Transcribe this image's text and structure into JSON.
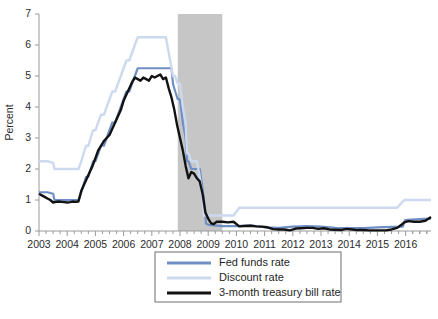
{
  "chart_data": {
    "type": "line",
    "title": "",
    "subtitle": "",
    "xlabel": "",
    "ylabel": "Percent",
    "ylim": [
      0,
      7
    ],
    "ytick_labels": [
      "0",
      "1",
      "2",
      "3",
      "4",
      "5",
      "6",
      "7"
    ],
    "ytick_values": [
      0,
      1,
      2,
      3,
      4,
      5,
      6,
      7
    ],
    "xlim": [
      2003.0,
      2016.9
    ],
    "xtick_labels": [
      "2003",
      "2004",
      "2005",
      "2006",
      "2007",
      "2008",
      "2009",
      "2010",
      "2011",
      "2012",
      "2013",
      "2014",
      "2015",
      "2016"
    ],
    "xtick_values": [
      2003,
      2004,
      2005,
      2006,
      2007,
      2008,
      2009,
      2010,
      2011,
      2012,
      2013,
      2014,
      2015,
      2016
    ],
    "x_minor_per_major": 4,
    "grid": false,
    "legend_position": "below-center",
    "annotations": [
      {
        "type": "shaded-band",
        "name": "recession-band",
        "x_start": 2007.92,
        "x_end": 2009.5,
        "color": "#c6c6c6",
        "label": ""
      }
    ],
    "series": [
      {
        "name": "Fed funds rate",
        "color": "#6f8fc4",
        "width": 2.2,
        "x": [
          2003.0,
          2003.3,
          2003.5,
          2003.55,
          2004.0,
          2004.4,
          2004.5,
          2004.58,
          2004.67,
          2004.75,
          2004.83,
          2004.92,
          2005.0,
          2005.1,
          2005.2,
          2005.3,
          2005.4,
          2005.5,
          2005.6,
          2005.7,
          2005.8,
          2005.9,
          2006.0,
          2006.1,
          2006.2,
          2006.3,
          2006.4,
          2006.5,
          2006.6,
          2007.0,
          2007.5,
          2007.7,
          2007.75,
          2007.83,
          2007.92,
          2008.0,
          2008.1,
          2008.2,
          2008.25,
          2008.3,
          2008.4,
          2008.5,
          2008.6,
          2008.7,
          2008.78,
          2008.85,
          2008.92,
          2009.0,
          2009.2,
          2009.5,
          2010.0,
          2010.5,
          2011.0,
          2011.5,
          2012.0,
          2012.5,
          2013.0,
          2013.5,
          2014.0,
          2014.5,
          2015.0,
          2015.5,
          2015.9,
          2015.98,
          2016.2,
          2016.5,
          2016.9
        ],
        "values": [
          1.25,
          1.25,
          1.2,
          1.0,
          1.0,
          1.0,
          1.25,
          1.5,
          1.75,
          1.75,
          2.0,
          2.25,
          2.25,
          2.5,
          2.75,
          2.75,
          3.0,
          3.25,
          3.5,
          3.5,
          3.75,
          4.0,
          4.25,
          4.5,
          4.5,
          4.75,
          5.0,
          5.25,
          5.25,
          5.25,
          5.25,
          5.25,
          4.75,
          4.5,
          4.25,
          4.25,
          3.5,
          3.0,
          2.25,
          2.25,
          2.0,
          2.0,
          2.0,
          2.0,
          1.5,
          1.0,
          0.25,
          0.2,
          0.18,
          0.16,
          0.16,
          0.18,
          0.12,
          0.1,
          0.14,
          0.16,
          0.14,
          0.1,
          0.09,
          0.09,
          0.12,
          0.13,
          0.14,
          0.35,
          0.37,
          0.38,
          0.4
        ]
      },
      {
        "name": "Discount rate",
        "color": "#ccd9ee",
        "width": 2.4,
        "x": [
          2003.0,
          2003.3,
          2003.5,
          2003.55,
          2004.0,
          2004.4,
          2004.5,
          2004.58,
          2004.67,
          2004.75,
          2004.83,
          2004.92,
          2005.0,
          2005.1,
          2005.2,
          2005.3,
          2005.4,
          2005.5,
          2005.6,
          2005.7,
          2005.8,
          2005.9,
          2006.0,
          2006.1,
          2006.2,
          2006.3,
          2006.4,
          2006.5,
          2006.6,
          2007.0,
          2007.5,
          2007.6,
          2007.7,
          2007.75,
          2007.83,
          2007.92,
          2008.0,
          2008.1,
          2008.2,
          2008.25,
          2008.3,
          2008.4,
          2008.5,
          2008.6,
          2008.7,
          2008.78,
          2008.85,
          2008.92,
          2009.0,
          2009.2,
          2009.5,
          2009.7,
          2009.9,
          2010.1,
          2010.5,
          2011.0,
          2012.0,
          2013.0,
          2014.0,
          2015.0,
          2015.7,
          2015.95,
          2016.1,
          2016.5,
          2016.9
        ],
        "values": [
          2.25,
          2.25,
          2.2,
          2.0,
          2.0,
          2.0,
          2.25,
          2.5,
          2.75,
          2.75,
          3.0,
          3.25,
          3.25,
          3.5,
          3.75,
          3.75,
          4.0,
          4.25,
          4.5,
          4.5,
          4.75,
          5.0,
          5.25,
          5.5,
          5.5,
          5.75,
          6.0,
          6.25,
          6.25,
          6.25,
          6.25,
          5.75,
          5.25,
          5.0,
          5.0,
          4.75,
          4.75,
          4.0,
          3.5,
          2.5,
          2.5,
          2.25,
          2.25,
          2.25,
          1.75,
          1.25,
          0.5,
          0.5,
          0.5,
          0.5,
          0.5,
          0.5,
          0.5,
          0.75,
          0.75,
          0.75,
          0.75,
          0.75,
          0.75,
          0.75,
          0.75,
          1.0,
          1.0,
          1.0,
          1.0
        ]
      },
      {
        "name": "3-month treasury bill rate",
        "color": "#121212",
        "width": 2.4,
        "x": [
          2003.0,
          2003.1,
          2003.2,
          2003.3,
          2003.4,
          2003.5,
          2003.6,
          2003.7,
          2003.8,
          2003.9,
          2004.0,
          2004.1,
          2004.2,
          2004.3,
          2004.4,
          2004.5,
          2004.6,
          2004.7,
          2004.8,
          2004.9,
          2005.0,
          2005.1,
          2005.2,
          2005.3,
          2005.4,
          2005.5,
          2005.6,
          2005.7,
          2005.8,
          2005.9,
          2006.0,
          2006.1,
          2006.2,
          2006.3,
          2006.4,
          2006.5,
          2006.6,
          2006.7,
          2006.8,
          2006.9,
          2007.0,
          2007.1,
          2007.2,
          2007.3,
          2007.4,
          2007.5,
          2007.6,
          2007.7,
          2007.8,
          2007.9,
          2008.0,
          2008.1,
          2008.2,
          2008.3,
          2008.4,
          2008.5,
          2008.6,
          2008.7,
          2008.8,
          2008.9,
          2009.0,
          2009.1,
          2009.2,
          2009.3,
          2009.5,
          2009.7,
          2009.9,
          2010.1,
          2010.3,
          2010.5,
          2010.7,
          2010.9,
          2011.1,
          2011.3,
          2011.5,
          2011.7,
          2011.9,
          2012.1,
          2012.3,
          2012.5,
          2012.7,
          2012.9,
          2013.1,
          2013.3,
          2013.5,
          2013.7,
          2013.9,
          2014.1,
          2014.3,
          2014.5,
          2014.7,
          2014.9,
          2015.1,
          2015.3,
          2015.5,
          2015.7,
          2015.85,
          2015.95,
          2016.1,
          2016.3,
          2016.5,
          2016.7,
          2016.9
        ],
        "values": [
          1.2,
          1.15,
          1.1,
          1.05,
          1.0,
          0.92,
          0.94,
          0.95,
          0.94,
          0.93,
          0.92,
          0.93,
          0.95,
          0.94,
          0.95,
          1.3,
          1.5,
          1.7,
          1.9,
          2.1,
          2.35,
          2.6,
          2.75,
          2.9,
          3.0,
          3.1,
          3.3,
          3.5,
          3.7,
          3.9,
          4.2,
          4.4,
          4.6,
          4.8,
          4.95,
          4.9,
          4.85,
          4.95,
          4.9,
          4.85,
          5.0,
          4.95,
          5.0,
          5.05,
          4.9,
          4.95,
          4.6,
          4.3,
          3.9,
          3.4,
          3.0,
          2.6,
          2.1,
          1.7,
          1.9,
          1.85,
          1.7,
          1.6,
          1.2,
          0.6,
          0.4,
          0.25,
          0.22,
          0.3,
          0.3,
          0.28,
          0.3,
          0.15,
          0.16,
          0.17,
          0.15,
          0.14,
          0.12,
          0.06,
          0.05,
          0.05,
          0.02,
          0.08,
          0.09,
          0.1,
          0.1,
          0.07,
          0.09,
          0.05,
          0.04,
          0.03,
          0.07,
          0.05,
          0.03,
          0.03,
          0.02,
          0.02,
          0.02,
          0.02,
          0.05,
          0.1,
          0.2,
          0.28,
          0.32,
          0.3,
          0.3,
          0.33,
          0.45
        ]
      }
    ]
  },
  "legend": {
    "entries": [
      {
        "label": "Fed funds rate",
        "color": "#6f8fc4"
      },
      {
        "label": "Discount rate",
        "color": "#ccd9ee"
      },
      {
        "label": "3-month treasury bill rate",
        "color": "#121212"
      }
    ]
  },
  "colors": {
    "fed_funds": "#6f8fc4",
    "discount": "#ccd9ee",
    "tbill": "#121212",
    "recession_shade": "#c6c6c6",
    "axis": "#9a9a9a",
    "text": "#2b2b2b",
    "background": "#ffffff"
  }
}
